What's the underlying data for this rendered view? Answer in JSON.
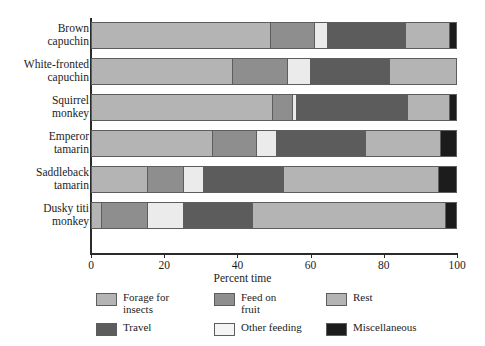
{
  "chart_data": {
    "type": "bar",
    "orientation": "horizontal",
    "stacked": true,
    "title": "",
    "xlabel": "Percent time",
    "ylabel": "",
    "xlim": [
      0,
      100
    ],
    "xticks": [
      0,
      20,
      40,
      60,
      80,
      100
    ],
    "grid": false,
    "legend_position": "bottom",
    "categories": [
      "Brown capuchin",
      "White-fronted capuchin",
      "Squirrel monkey",
      "Emperor tamarin",
      "Saddleback tamarin",
      "Dusky titi monkey"
    ],
    "series": [
      {
        "name": "Forage for insects",
        "color": "#b4b4b4",
        "values": [
          49.0,
          38.5,
          49.5,
          33.0,
          15.0,
          2.5
        ]
      },
      {
        "name": "Feed on fruit",
        "color": "#8e8e8e",
        "values": [
          12.0,
          15.0,
          5.5,
          12.0,
          10.0,
          12.5
        ]
      },
      {
        "name": "Other feeding",
        "color": "#ebebeb",
        "values": [
          3.5,
          6.5,
          1.0,
          5.5,
          5.5,
          10.0
        ]
      },
      {
        "name": "Travel",
        "color": "#5c5c5c",
        "values": [
          21.5,
          21.5,
          30.5,
          24.5,
          22.0,
          19.0
        ]
      },
      {
        "name": "Rest",
        "color": "#b4b4b4",
        "values": [
          12.0,
          18.5,
          11.5,
          20.5,
          42.5,
          53.0
        ]
      },
      {
        "name": "Miscellaneous",
        "color": "#1c1c1c",
        "values": [
          2.0,
          0.0,
          2.0,
          4.5,
          5.0,
          3.0
        ]
      }
    ]
  },
  "axis": {
    "x_title": "Percent time",
    "x_tick_labels": [
      "0",
      "20",
      "40",
      "60",
      "80",
      "100"
    ],
    "y_tick_labels": [
      [
        "Brown",
        "capuchin"
      ],
      [
        "White-fronted",
        "capuchin"
      ],
      [
        "Squirrel",
        "monkey"
      ],
      [
        "Emperor",
        "tamarin"
      ],
      [
        "Saddleback",
        "tamarin"
      ],
      [
        "Dusky titi",
        "monkey"
      ]
    ]
  },
  "legend": {
    "items": [
      {
        "label_lines": [
          "Forage for",
          "insects"
        ],
        "color": "#b4b4b4",
        "swatch_name": "swatch-forage-for-insects"
      },
      {
        "label_lines": [
          "Feed on",
          "fruit"
        ],
        "color": "#8e8e8e",
        "swatch_name": "swatch-feed-on-fruit"
      },
      {
        "label_lines": [
          "Rest"
        ],
        "color": "#b4b4b4",
        "swatch_name": "swatch-rest"
      },
      {
        "label_lines": [
          "Travel"
        ],
        "color": "#5c5c5c",
        "swatch_name": "swatch-travel"
      },
      {
        "label_lines": [
          "Other feeding"
        ],
        "color": "#f4f4f4",
        "swatch_name": "swatch-other-feeding"
      },
      {
        "label_lines": [
          "Miscellaneous"
        ],
        "color": "#1c1c1c",
        "swatch_name": "swatch-miscellaneous"
      }
    ]
  }
}
